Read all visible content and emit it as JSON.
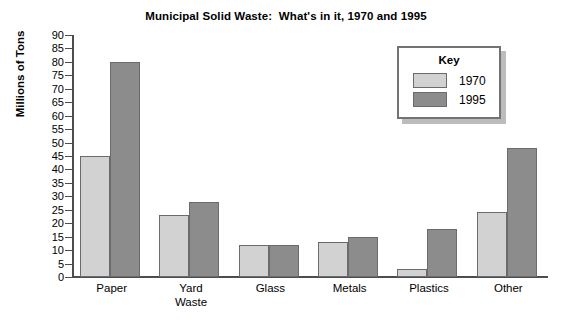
{
  "chart_data": {
    "type": "bar",
    "title": "Municipal Solid Waste:  What's in it, 1970 and 1995",
    "xlabel": "",
    "ylabel": "Millions of Tons",
    "ylim": [
      0,
      90
    ],
    "ytick_step": 5,
    "yticks": [
      90,
      85,
      80,
      75,
      70,
      65,
      60,
      55,
      50,
      45,
      40,
      35,
      30,
      25,
      20,
      15,
      10,
      5,
      0
    ],
    "grid": false,
    "legend_position": "upper-right",
    "legend_title": "Key",
    "categories": [
      "Paper",
      "Yard\nWaste",
      "Glass",
      "Metals",
      "Plastics",
      "Other"
    ],
    "series": [
      {
        "name": "1970",
        "color": "#d2d2d2",
        "values": [
          45,
          23,
          12,
          13,
          3,
          24
        ]
      },
      {
        "name": "1995",
        "color": "#8c8c8c",
        "values": [
          80,
          28,
          12,
          15,
          18,
          48
        ]
      }
    ]
  },
  "colors": {
    "series_1970": "#d2d2d2",
    "series_1995": "#8c8c8c",
    "axis": "#4d4d4d",
    "bar_outline": "#6b6b6b",
    "legend_border": "#737373",
    "legend_shadow": "#bcbcbc"
  }
}
